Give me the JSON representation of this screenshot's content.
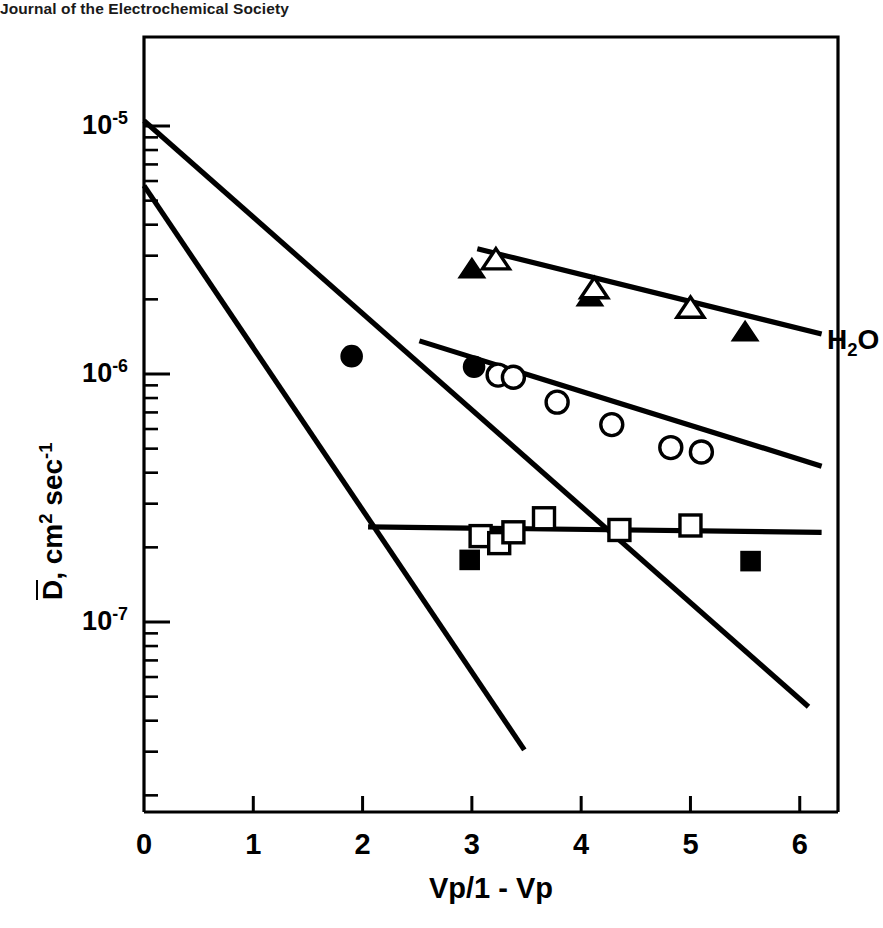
{
  "credit": "Journal of the Electrochemical Society",
  "chart_data": {
    "type": "scatter",
    "title": "",
    "xlabel": "Vp/1 - Vp",
    "ylabel": "D̄, cm2 sec-1",
    "ylabel_parts": {
      "symbol": "D",
      "rest": ", cm",
      "exp1": "2",
      "mid": " sec",
      "exp2": "-1"
    },
    "xlim": [
      0,
      6.35
    ],
    "ylim": [
      1.9e-08,
      1.35e-05
    ],
    "yscale": "log",
    "xscale": "linear",
    "grid": false,
    "legend_position": "inline-right",
    "xticks": [
      0,
      1,
      2,
      3,
      4,
      5,
      6
    ],
    "xtick_labels": [
      "0",
      "1",
      "2",
      "3",
      "4",
      "5",
      "6"
    ],
    "ytick_majors": [
      {
        "value": 1e-05,
        "mantissa": "10",
        "exponent": "-5"
      },
      {
        "value": 1e-06,
        "mantissa": "10",
        "exponent": "-6"
      },
      {
        "value": 1e-07,
        "mantissa": "10",
        "exponent": "-7"
      }
    ],
    "series": [
      {
        "name": "H2O",
        "label": "H2O",
        "label_parts": {
          "pre": "H",
          "sub": "2",
          "post": "O"
        },
        "marker_open": "triangle",
        "marker_filled": "triangle",
        "fit_line": {
          "x0": 3.05,
          "y0": 3.2e-06,
          "x1": 6.2,
          "y1": 1.45e-06
        },
        "points_open": [
          {
            "x": 3.22,
            "y": 2.85e-06
          },
          {
            "x": 4.12,
            "y": 2.18e-06
          },
          {
            "x": 5.0,
            "y": 1.82e-06
          }
        ],
        "points_filled": [
          {
            "x": 3.0,
            "y": 2.62e-06
          },
          {
            "x": 4.08,
            "y": 2.02e-06
          },
          {
            "x": 5.5,
            "y": 1.46e-06
          }
        ],
        "point_labels": [
          {
            "x": 2.98,
            "y": 2.05e-06,
            "text": "Na+",
            "ion": "Na",
            "charge": "+"
          },
          {
            "x": 4.05,
            "y": 1.62e-06,
            "text": "K+",
            "ion": "K",
            "charge": "+"
          },
          {
            "x": 5.47,
            "y": 1.12e-06,
            "text": "Cs+",
            "ion": "Cs",
            "charge": "+"
          }
        ]
      },
      {
        "name": "Na+ sorbed",
        "label": "Na+",
        "label_parts": {
          "pre": "Na",
          "sup": "+"
        },
        "marker_open": "circle",
        "marker_filled": "circle",
        "fit_line": {
          "x0": 2.52,
          "y0": 1.36e-06,
          "x1": 6.2,
          "y1": 4.25e-07
        },
        "points_open": [
          {
            "x": 3.24,
            "y": 9.9e-07
          },
          {
            "x": 3.38,
            "y": 9.7e-07
          },
          {
            "x": 3.78,
            "y": 7.7e-07
          },
          {
            "x": 4.28,
            "y": 6.25e-07
          },
          {
            "x": 4.82,
            "y": 5.05e-07
          },
          {
            "x": 5.1,
            "y": 4.85e-07
          }
        ],
        "points_filled": [
          {
            "x": 1.9,
            "y": 1.18e-06
          },
          {
            "x": 3.02,
            "y": 1.07e-06
          }
        ],
        "point_labels": []
      },
      {
        "name": "Cs+ sorbed",
        "label": "Cs+",
        "label_parts": {
          "pre": "Cs",
          "sup": "+"
        },
        "marker_open": "square",
        "marker_filled": "square",
        "fit_line": {
          "x0": 2.05,
          "y0": 2.42e-07,
          "x1": 6.2,
          "y1": 2.3e-07
        },
        "points_open": [
          {
            "x": 3.08,
            "y": 2.22e-07
          },
          {
            "x": 3.25,
            "y": 2.08e-07
          },
          {
            "x": 3.38,
            "y": 2.3e-07
          },
          {
            "x": 3.66,
            "y": 2.62e-07
          },
          {
            "x": 4.35,
            "y": 2.35e-07
          },
          {
            "x": 5.0,
            "y": 2.45e-07
          }
        ],
        "points_filled": [
          {
            "x": 2.98,
            "y": 1.78e-07
          },
          {
            "x": 5.55,
            "y": 1.76e-07
          }
        ],
        "point_labels": []
      },
      {
        "name": "Na+ theory",
        "label": "Na+",
        "label_parts": {
          "pre": "Na",
          "sup": "+"
        },
        "marker_open": null,
        "marker_filled": null,
        "fit_line": {
          "x0": 0.0,
          "y0": 5.75e-06,
          "x1": 3.48,
          "y1": 3.05e-08
        },
        "points_open": [],
        "points_filled": [],
        "point_labels": []
      },
      {
        "name": "Cs+ theory",
        "label": "Cs+",
        "label_parts": {
          "pre": "Cs",
          "sup": "+"
        },
        "marker_open": null,
        "marker_filled": null,
        "fit_line": {
          "x0": 0.0,
          "y0": 1.05e-05,
          "x1": 6.08,
          "y1": 4.55e-08
        },
        "points_open": [],
        "points_filled": [],
        "point_labels": []
      }
    ],
    "series_end_labels": [
      {
        "name": "H2O",
        "x": 6.25,
        "y": 1.35e-06
      },
      {
        "name": "Na+",
        "x": 6.25,
        "y": 4e-07
      },
      {
        "name": "Cs+",
        "x": 6.25,
        "y": 2.2e-07
      },
      {
        "name": "Na+ theory",
        "x": 3.62,
        "y": 2.6e-08
      },
      {
        "name": "Cs+ theory",
        "x": 5.3,
        "y": 6.6e-08
      }
    ]
  }
}
